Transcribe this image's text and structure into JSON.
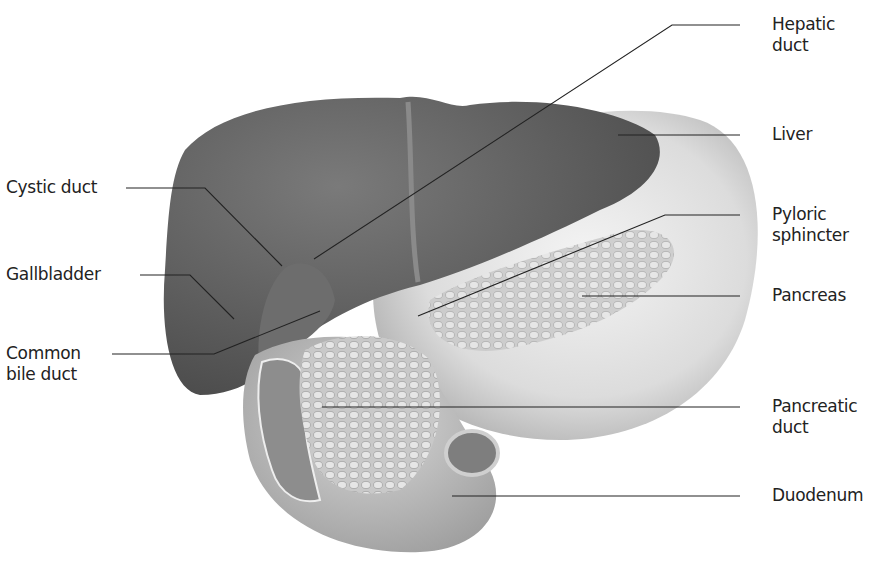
{
  "diagram": {
    "labels_left": [
      {
        "id": "cystic-duct",
        "text": "Cystic duct"
      },
      {
        "id": "gallbladder",
        "text": "Gallbladder"
      },
      {
        "id": "common-bile-duct",
        "text": "Common\nbile duct"
      }
    ],
    "labels_right": [
      {
        "id": "hepatic-duct",
        "text": "Hepatic\nduct"
      },
      {
        "id": "liver",
        "text": "Liver"
      },
      {
        "id": "pyloric-sphincter",
        "text": "Pyloric\nsphincter"
      },
      {
        "id": "pancreas",
        "text": "Pancreas"
      },
      {
        "id": "pancreatic-duct",
        "text": "Pancreatic\nduct"
      },
      {
        "id": "duodenum",
        "text": "Duodenum"
      }
    ]
  }
}
